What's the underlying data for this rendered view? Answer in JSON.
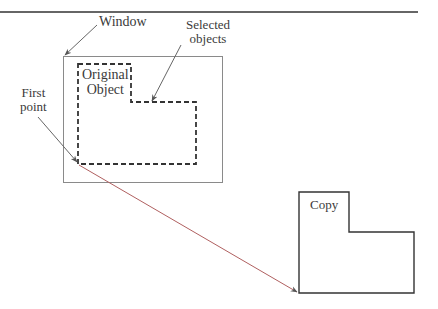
{
  "labels": {
    "window": "Window",
    "selected_line1": "Selected",
    "selected_line2": "objects",
    "original_line1": "Original",
    "original_line2": "Object",
    "first_line1": "First",
    "first_line2": "point",
    "copy": "Copy"
  },
  "colors": {
    "line": "#333333",
    "window_border": "#8a8a8a",
    "arrow": "#6a6a6a"
  }
}
